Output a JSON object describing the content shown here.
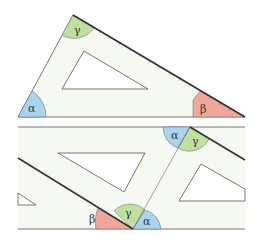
{
  "colors": {
    "alpha": "#a9d3ee",
    "beta": "#eea79b",
    "gamma": "#bfe0a0",
    "body": "#f6f8f2",
    "edge": "#555555",
    "ruler_edge": "#333333",
    "background": "#ffffff"
  },
  "top_figure": {
    "angles": {
      "alpha": "α",
      "beta": "β",
      "gamma": "γ"
    },
    "ruler_ticks": [
      "1",
      "2",
      "3",
      "4",
      "5",
      "6",
      "7",
      "8",
      "9",
      "10",
      "11",
      "12",
      "13",
      "14",
      "15",
      "16",
      "17",
      "18",
      "19",
      "20",
      "21"
    ]
  },
  "bottom_figure": {
    "left_triangle": {
      "beta": "β",
      "gamma": "γ"
    },
    "right_triangle": {
      "alpha_bottom": "α",
      "alpha_top": "α",
      "gamma_top": "γ"
    }
  }
}
